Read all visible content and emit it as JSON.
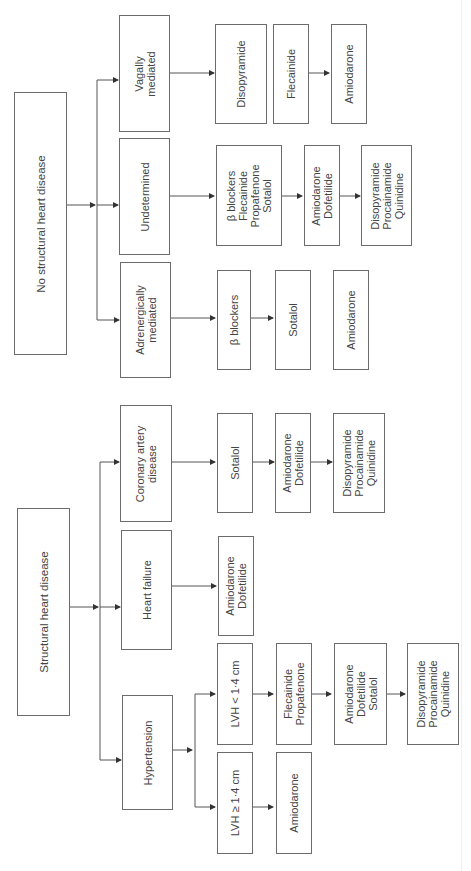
{
  "diagram": {
    "orientation": "rotated -90deg (read bottom-to-top)",
    "roots": [
      {
        "id": "no-structural",
        "label": "No structural heart disease",
        "children": [
          {
            "id": "vagal",
            "label": "Vagally\nmediated",
            "sequence": [
              "Disopyramide",
              "Flecainide",
              "Amiodarone"
            ]
          },
          {
            "id": "undetermined",
            "label": "Undetermined",
            "sequence": [
              "β blockers\nFlecainide\nPropafenone\nSotalol",
              "Amiodarone\nDofetilide",
              "Disopyramide\nProcainamide\nQuinidine"
            ]
          },
          {
            "id": "adrenergic",
            "label": "Adrenergically\nmediated",
            "sequence": [
              "β blockers",
              "Sotalol",
              "Amiodarone"
            ]
          }
        ]
      },
      {
        "id": "structural",
        "label": "Structural heart disease",
        "children": [
          {
            "id": "cad",
            "label": "Coronary artery\ndisease",
            "sequence": [
              "Sotalol",
              "Amiodarone\nDofetilide",
              "Disopyramide\nProcainamide\nQuinidine"
            ]
          },
          {
            "id": "hf",
            "label": "Heart failure",
            "sequence": [
              "Amiodarone\nDofetilide"
            ]
          },
          {
            "id": "htn",
            "label": "Hypertension",
            "children": [
              {
                "id": "lvh-lt",
                "label": "LVH < 1·4 cm",
                "sequence": [
                  "Flecainide\nPropafenone",
                  "Amiodarone\nDofetilide\nSotalol",
                  "Disopyramide\nProcainamide\nQuinidine"
                ]
              },
              {
                "id": "lvh-ge",
                "label": "LVH ≥ 1·4 cm",
                "sequence": [
                  "Amiodarone"
                ]
              }
            ]
          }
        ]
      }
    ]
  },
  "boxes": {
    "no_structural": "No structural heart disease",
    "vagal": "Vagally\nmediated",
    "vagal_1": "Disopyramide",
    "vagal_2": "Flecainide",
    "vagal_3": "Amiodarone",
    "undetermined": "Undetermined",
    "und_1": "β blockers\nFlecainide\nPropafenone\nSotalol",
    "und_2": "Amiodarone\nDofetilide",
    "und_3": "Disopyramide\nProcainamide\nQuinidine",
    "adrenergic": "Adrenergically\nmediated",
    "adr_1": "β blockers",
    "adr_2": "Sotalol",
    "adr_3": "Amiodarone",
    "structural": "Structural heart disease",
    "cad": "Coronary artery\ndisease",
    "cad_1": "Sotalol",
    "cad_2": "Amiodarone\nDofetilide",
    "cad_3": "Disopyramide\nProcainamide\nQuinidine",
    "hf": "Heart failure",
    "hf_1": "Amiodarone\nDofetilide",
    "htn": "Hypertension",
    "lvh_lt": "LVH < 1·4 cm",
    "lvh_lt_1": "Flecainide\nPropafenone",
    "lvh_lt_2": "Amiodarone\nDofetilide\nSotalol",
    "lvh_lt_3": "Disopyramide\nProcainamide\nQuinidine",
    "lvh_ge": "LVH ≥ 1·4 cm",
    "lvh_ge_1": "Amiodarone"
  },
  "colors": {
    "line": "#333333",
    "border": "#6b6b6b",
    "text": "#444444",
    "background": "#ffffff"
  }
}
